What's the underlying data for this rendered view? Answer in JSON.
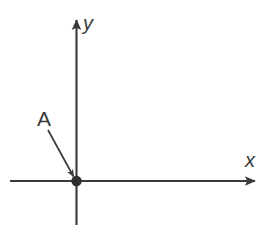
{
  "figure": {
    "background_color": "#ffffff",
    "stroke_color": "#3a3a3a",
    "width": 280,
    "height": 232
  },
  "axes": {
    "x_axis": {
      "label": "x",
      "label_x": 250,
      "label_y": 167,
      "line_y": 181,
      "line_x_start": 10,
      "line_x_end": 255,
      "arrow_tip_x": 263,
      "direction": "right"
    },
    "y_axis": {
      "label": "y",
      "label_x": 83,
      "label_y": 30,
      "line_x": 76.5,
      "line_y_start": 20,
      "line_y_end": 225,
      "arrow_tip_y": 11,
      "direction": "up"
    }
  },
  "points": [
    {
      "name": "A",
      "label": "A",
      "label_x": 37,
      "label_y": 126,
      "dot_x": 76.5,
      "dot_y": 181,
      "dot_radius": 5.2,
      "description": "origin"
    }
  ],
  "leader_arrow": {
    "from_x": 48,
    "from_y": 130,
    "to_x": 73.5,
    "to_y": 176.5
  }
}
